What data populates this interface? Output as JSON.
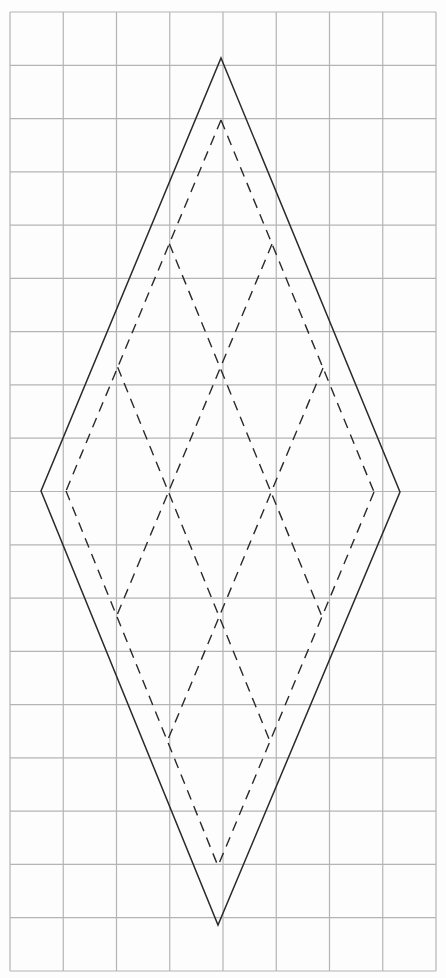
{
  "canvas": {
    "width": 446,
    "height": 978,
    "background": "#fdfdfd"
  },
  "grid": {
    "left": 10,
    "top": 12,
    "right": 436,
    "bottom": 971,
    "columns": 8,
    "rows": 18,
    "color": "#b4b4b4"
  },
  "outer_rhombus": {
    "style": "solid",
    "color": "#2a2a2a",
    "vertices": {
      "top": [
        221,
        58
      ],
      "right": [
        400,
        492
      ],
      "bottom": [
        218,
        925
      ],
      "left": [
        41,
        491
      ]
    }
  },
  "inner_rhombus": {
    "style": "dashed",
    "color": "#2a2a2a",
    "subdivisions": 3,
    "vertices": {
      "top": [
        221,
        120
      ],
      "right": [
        374,
        492
      ],
      "bottom": [
        218,
        866
      ],
      "left": [
        66,
        491
      ]
    }
  }
}
